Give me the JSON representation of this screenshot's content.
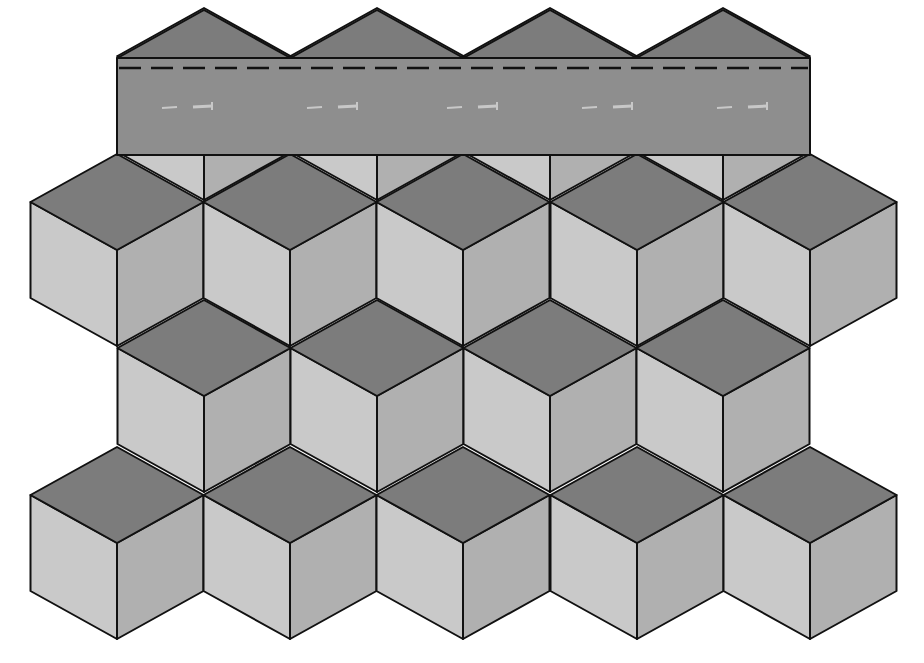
{
  "diagram": {
    "title": "Tumbling blocks quilt pattern with top border strip",
    "pattern": "tumbling-blocks",
    "colors": {
      "top_face": "#7c7c7c",
      "left_face": "#c9c9c9",
      "right_face": "#b0b0b0",
      "banner": "#8e8e8e",
      "banner_triangle": "#7c7c7c",
      "outline": "#111111",
      "stitch_line": "#111111",
      "needle_marks": "#c8c8c8",
      "background": "#ffffff"
    },
    "geometry": {
      "cube_width": 173,
      "cube_half_height_edge": 48,
      "rows": [
        {
          "name": "row-1",
          "center_y": 250,
          "centers_x": [
            117,
            290,
            463,
            637,
            810
          ]
        },
        {
          "name": "row-2",
          "center_y": 396,
          "centers_x": [
            204,
            377,
            550,
            723
          ]
        },
        {
          "name": "row-3",
          "center_y": 543,
          "centers_x": [
            117,
            290,
            463,
            637,
            810
          ]
        }
      ],
      "gap_row": {
        "center_y": 104,
        "centers_x": [
          204,
          377,
          550,
          723
        ]
      }
    },
    "banner": {
      "x": 117,
      "y": 58,
      "width": 693,
      "height": 97,
      "stitch_y": 68,
      "needle_marks_y": 107,
      "needle_marks_x": [
        185,
        330,
        470,
        605,
        740
      ],
      "peak_y": 10,
      "peaks_x": [
        204,
        377,
        550,
        723
      ]
    },
    "counts": {
      "cubes": 14,
      "banner_triangles": 4,
      "needle_marks": 5
    }
  }
}
